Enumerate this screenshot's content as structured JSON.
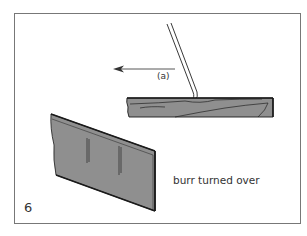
{
  "figure": {
    "number": "6",
    "labels": {
      "direction": "(a)",
      "burr": "burr turned over"
    },
    "elements": [
      {
        "name": "burnisher",
        "description": "Burnishing rod angled against plank edge"
      },
      {
        "name": "direction-arrow",
        "description": "Arrow pointing left indicating stroke direction (a)"
      },
      {
        "name": "plank",
        "description": "Wood plank cross-section with grain lines"
      },
      {
        "name": "scraper",
        "description": "Cabinet scraper blade in perspective with burr turned over"
      }
    ],
    "colors": {
      "fill": "#8f8f8f",
      "stroke": "#1a1a1a",
      "frame": "#777777"
    }
  }
}
